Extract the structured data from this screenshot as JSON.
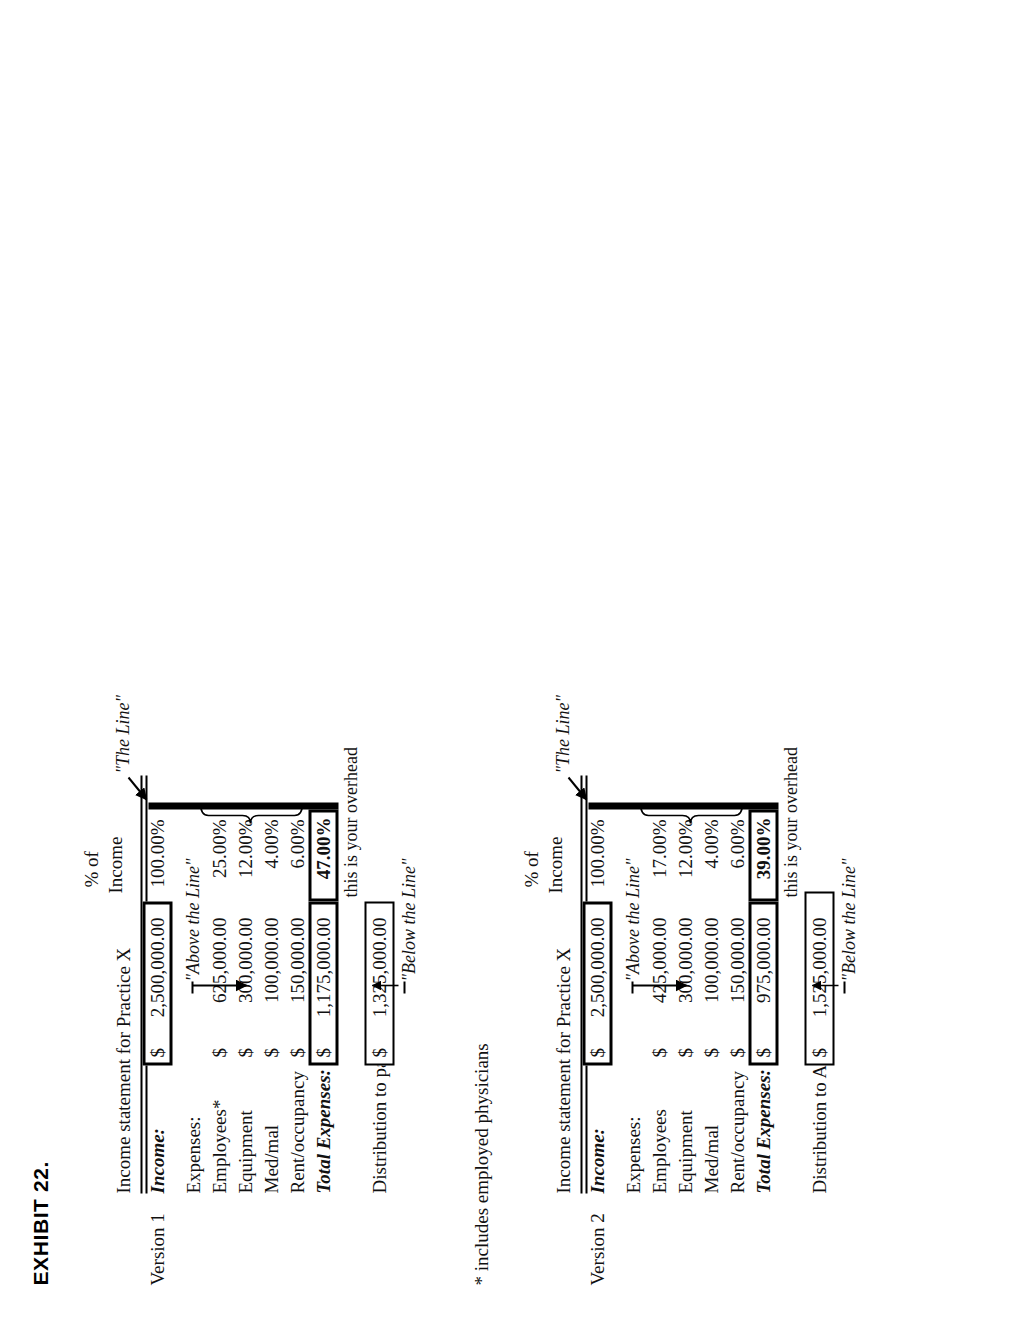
{
  "exhibit": {
    "title": "EXHIBIT 22."
  },
  "column_header": {
    "line1": "% of",
    "line2": "Income"
  },
  "statement_title": "Income statement for Practice X",
  "labels": {
    "income": "Income:",
    "expenses": "Expenses:",
    "total_expenses": "Total Expenses:"
  },
  "annotations": {
    "the_line": "\"The Line\"",
    "above_the_line": "\"Above the Line\"",
    "below_the_line": "\"Below the Line\"",
    "overhead": "this is your overhead"
  },
  "footnote": "* includes employed physicians",
  "versions": [
    {
      "name": "Version 1",
      "income": {
        "label": "Income:",
        "symbol": "$",
        "amount": "2,500,000.00",
        "percent": "100.00%"
      },
      "expenses": [
        {
          "label": "Employees*",
          "symbol": "$",
          "amount": "625,000.00",
          "percent": "25.00%"
        },
        {
          "label": "Equipment",
          "symbol": "$",
          "amount": "300,000.00",
          "percent": "12.00%"
        },
        {
          "label": "Med/mal",
          "symbol": "$",
          "amount": "100,000.00",
          "percent": "4.00%"
        },
        {
          "label": "Rent/occupancy",
          "symbol": "$",
          "amount": "150,000.00",
          "percent": "6.00%"
        }
      ],
      "total": {
        "label": "Total Expenses:",
        "symbol": "$",
        "amount": "1,175,000.00",
        "percent": "47.00%"
      },
      "distribution": {
        "label": "Distribution to partners:",
        "symbol": "$",
        "amount": "1,325,000.00"
      }
    },
    {
      "name": "Version 2",
      "income": {
        "label": "Income:",
        "symbol": "$",
        "amount": "2,500,000.00",
        "percent": "100.00%"
      },
      "expenses": [
        {
          "label": "Employees",
          "symbol": "$",
          "amount": "425,000.00",
          "percent": "17.00%"
        },
        {
          "label": "Equipment",
          "symbol": "$",
          "amount": "300,000.00",
          "percent": "12.00%"
        },
        {
          "label": "Med/mal",
          "symbol": "$",
          "amount": "100,000.00",
          "percent": "4.00%"
        },
        {
          "label": "Rent/occupancy",
          "symbol": "$",
          "amount": "150,000.00",
          "percent": "6.00%"
        }
      ],
      "total": {
        "label": "Total Expenses:",
        "symbol": "$",
        "amount": "975,000.00",
        "percent": "39.00%"
      },
      "distribution": {
        "label": "Distribution to ALL physicians:",
        "symbol": "$",
        "amount": "1,525,000.00"
      }
    }
  ]
}
